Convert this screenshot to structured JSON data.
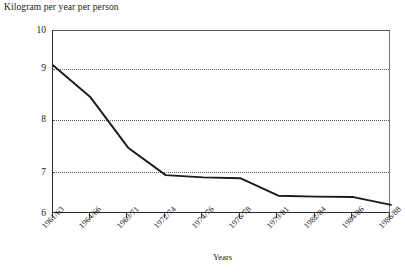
{
  "chart_title": "Kilogram per year per person",
  "axis_title_x": "Years",
  "colors": {
    "line": "#1a1a1a",
    "axis": "#2b2b2b",
    "grid": "#5a5a5a"
  },
  "yticks": [
    "10",
    "9",
    "8",
    "7",
    "6"
  ],
  "chart_data": {
    "type": "line",
    "title": "Kilogram per year per person",
    "xlabel": "Years",
    "ylabel": "Kilogram per year per person",
    "ylim": [
      6,
      10
    ],
    "yticks": [
      6,
      7,
      8,
      9,
      10
    ],
    "grid": true,
    "gridlines_at": [
      7,
      8,
      9
    ],
    "legend": null,
    "categories": [
      "1961/63",
      "1964/66",
      "1969/71",
      "1972/74",
      "1974/76",
      "1976/78",
      "1979/81",
      "1982/84",
      "1984/86",
      "1986/88"
    ],
    "values": [
      9.25,
      8.55,
      7.45,
      6.85,
      6.8,
      6.78,
      6.4,
      6.38,
      6.37,
      6.2
    ],
    "series": [
      {
        "name": "Consumption",
        "values": [
          9.25,
          8.55,
          7.45,
          6.85,
          6.8,
          6.78,
          6.4,
          6.38,
          6.37,
          6.2
        ]
      }
    ]
  }
}
